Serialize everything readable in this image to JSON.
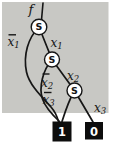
{
  "diagram": {
    "output_label": "f",
    "node_symbol": "S",
    "edges": {
      "x1_neg": {
        "base": "x",
        "sub": "1",
        "negated": true
      },
      "x1": {
        "base": "x",
        "sub": "1",
        "negated": false
      },
      "x2_neg": {
        "base": "x",
        "sub": "2",
        "negated": true
      },
      "x2": {
        "base": "x",
        "sub": "2",
        "negated": false
      },
      "x3_neg": {
        "base": "x",
        "sub": "3",
        "negated": true
      },
      "x3": {
        "base": "x",
        "sub": "3",
        "negated": false
      }
    },
    "terminals": {
      "one": "1",
      "zero": "0"
    },
    "colors": {
      "background": "#c8c8c4",
      "node_fill": "#ffffff",
      "node_stroke": "#161616",
      "edge": "#161616",
      "terminal_fill": "#0d0d0d",
      "terminal_text": "#ffffff"
    }
  }
}
